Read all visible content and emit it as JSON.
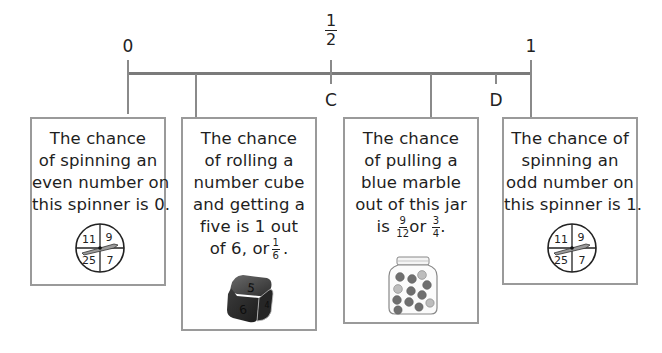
{
  "number_line": {
    "labels_above": [
      {
        "text": "0",
        "x": 128
      },
      {
        "fraction": {
          "num": "1",
          "den": "2"
        },
        "x": 331
      },
      {
        "text": "1",
        "x": 531
      }
    ],
    "labels_below": [
      {
        "text": "C",
        "x": 331
      },
      {
        "text": "D",
        "x": 496
      }
    ],
    "tick_positions": [
      128,
      196,
      331,
      431,
      496,
      531
    ],
    "color": "#7a7a7a"
  },
  "cards": [
    {
      "id": "even-spinner",
      "lines": [
        "The chance",
        "of spinning an",
        "even number on",
        "this spinner is 0."
      ],
      "picture": "spinner",
      "spinner_numbers": [
        "11",
        "9",
        "25",
        "7"
      ],
      "points_to": "0"
    },
    {
      "id": "number-cube",
      "lines": [
        "The chance",
        "of rolling a",
        "number cube",
        "and getting a",
        "five is 1 out"
      ],
      "last_line_prefix": "of 6, or",
      "last_line_fraction": {
        "num": "1",
        "den": "6"
      },
      "last_line_suffix": ".",
      "picture": "number-cube",
      "cube_faces": [
        "5",
        "6",
        "4"
      ],
      "points_to": "1/6"
    },
    {
      "id": "marble-jar",
      "lines": [
        "The chance",
        "of pulling a",
        "blue marble",
        "out of this jar"
      ],
      "last_line_prefix": "is",
      "last_line_fraction1": {
        "num": "9",
        "den": "12"
      },
      "last_line_mid": "or",
      "last_line_fraction2": {
        "num": "3",
        "den": "4"
      },
      "last_line_suffix": ".",
      "picture": "marble-jar",
      "points_to": "3/4"
    },
    {
      "id": "odd-spinner",
      "lines": [
        "The chance of",
        "spinning an",
        "odd number on",
        "this spinner is 1."
      ],
      "picture": "spinner",
      "spinner_numbers": [
        "11",
        "9",
        "25",
        "7"
      ],
      "points_to": "1"
    }
  ],
  "colors": {
    "line": "#7a7a7a",
    "card_border": "#9a9a9a",
    "text": "#1e1e1e",
    "cube": "#3a3a3a",
    "marble": "#6f6f6f"
  }
}
